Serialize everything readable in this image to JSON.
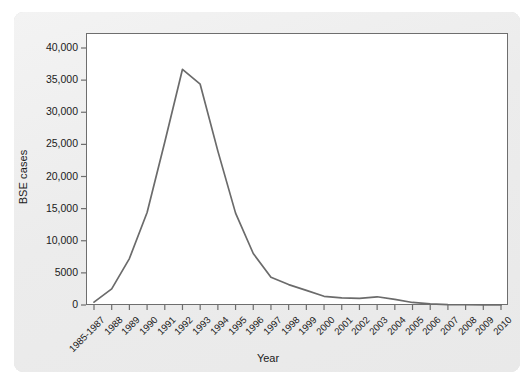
{
  "chart_data": {
    "type": "line",
    "title": "",
    "xlabel": "Year",
    "ylabel": "BSE cases",
    "categories": [
      "1985-1987",
      "1988",
      "1989",
      "1990",
      "1991",
      "1992",
      "1993",
      "1994",
      "1995",
      "1996",
      "1997",
      "1998",
      "1999",
      "2000",
      "2001",
      "2002",
      "2003",
      "2004",
      "2005",
      "2006",
      "2007",
      "2008",
      "2009",
      "2010"
    ],
    "values": [
      446,
      2514,
      7228,
      14407,
      25359,
      36682,
      34370,
      23945,
      14302,
      8016,
      4312,
      3179,
      2274,
      1355,
      1113,
      1044,
      1279,
      878,
      393,
      161,
      67,
      37,
      12,
      11
    ],
    "series": [
      {
        "name": "BSE cases",
        "values": [
          446,
          2514,
          7228,
          14407,
          25359,
          36682,
          34370,
          23945,
          14302,
          8016,
          4312,
          3179,
          2274,
          1355,
          1113,
          1044,
          1279,
          878,
          393,
          161,
          67,
          37,
          12,
          11
        ]
      }
    ],
    "ylim": [
      0,
      42000
    ],
    "yticks": [
      0,
      5000,
      10000,
      15000,
      20000,
      25000,
      30000,
      35000,
      40000
    ],
    "ytick_labels": [
      "0",
      "5000",
      "10,000",
      "15,000",
      "20,000",
      "25,000",
      "30,000",
      "35,000",
      "40,000"
    ],
    "grid": false,
    "legend": "none",
    "line_color": "#6b6b6b",
    "plot_background": "#ffffff",
    "panel_background": "#ededed",
    "axis_color": "#6e6e6e"
  }
}
